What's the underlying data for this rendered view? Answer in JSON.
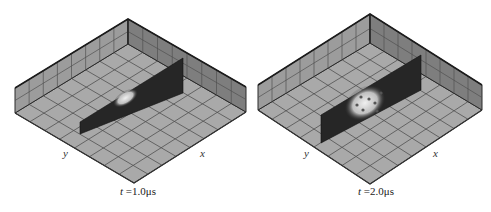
{
  "figure": {
    "panels": [
      {
        "id": "panel-1",
        "time_label": "t",
        "time_value": "=1.0μs",
        "axis_y_label": "y",
        "axis_x_label": "x",
        "geometry": {
          "back_top": [
            128,
            19
          ],
          "back_floor": [
            128,
            44
          ],
          "left_top": [
            15,
            88
          ],
          "left_floor": [
            15,
            113
          ],
          "right_top": [
            246,
            87
          ],
          "right_floor": [
            246,
            112
          ],
          "front_floor": [
            134,
            183
          ],
          "slab": {
            "x1": 80,
            "y1_top": 122,
            "y1_bot": 134,
            "x2": 183,
            "y2_top": 58,
            "y2_bot": 93
          }
        },
        "bright_region": "small",
        "label_pos": {
          "y": [
            63,
            148
          ],
          "x": [
            200,
            148
          ],
          "caption": [
            120,
            186
          ]
        }
      },
      {
        "id": "panel-2",
        "time_label": "t",
        "time_value": "=2.0μs",
        "axis_y_label": "y",
        "axis_x_label": "x",
        "geometry": {
          "back_top": [
            370,
            14
          ],
          "back_floor": [
            370,
            43
          ],
          "left_top": [
            258,
            85
          ],
          "left_floor": [
            258,
            110
          ],
          "right_top": [
            482,
            85
          ],
          "right_floor": [
            482,
            110
          ],
          "front_floor": [
            370,
            184
          ],
          "slab": {
            "x1": 321,
            "y1_top": 115,
            "y1_bot": 143,
            "x2": 421,
            "y2_top": 55,
            "y2_bot": 90
          }
        },
        "bright_region": "large",
        "label_pos": {
          "y": [
            304,
            148
          ],
          "x": [
            433,
            148
          ],
          "caption": [
            358,
            186
          ]
        }
      }
    ],
    "colors": {
      "floor": "#a9a9a9",
      "wall_left": "#9c9c9c",
      "wall_right": "#7e7e7e",
      "grid": "#505050",
      "edge": "#2a2a2a",
      "slab": "#262626",
      "bright": "#e0e0e0"
    }
  }
}
